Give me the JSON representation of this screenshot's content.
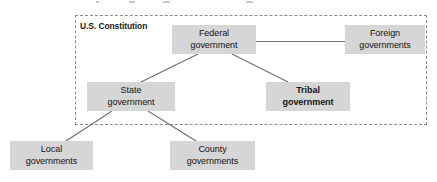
{
  "diagram": {
    "boundary": {
      "label": "U.S. Constitution",
      "border_style": "dashed",
      "border_color": "#8c8c8c"
    },
    "node_fill_color": "#d6d6d6",
    "node_text_color": "#141414",
    "connector_color": "#6e6e6e",
    "nodes": [
      {
        "id": "federal",
        "lines": [
          "Federal",
          "government"
        ],
        "bold": false,
        "inside_boundary": true,
        "x": 172,
        "y": 25,
        "w": 84,
        "h": 29
      },
      {
        "id": "foreign",
        "lines": [
          "Foreign",
          "governments"
        ],
        "bold": false,
        "inside_boundary": false,
        "x": 345,
        "y": 25,
        "w": 80,
        "h": 29
      },
      {
        "id": "state",
        "lines": [
          "State",
          "government"
        ],
        "bold": false,
        "inside_boundary": true,
        "x": 87,
        "y": 82,
        "w": 88,
        "h": 29
      },
      {
        "id": "tribal",
        "lines": [
          "Tribal",
          "government"
        ],
        "bold": true,
        "inside_boundary": true,
        "x": 266,
        "y": 82,
        "w": 84,
        "h": 29
      },
      {
        "id": "local",
        "lines": [
          "Local",
          "governments"
        ],
        "bold": false,
        "inside_boundary": false,
        "x": 10,
        "y": 141,
        "w": 83,
        "h": 29
      },
      {
        "id": "county",
        "lines": [
          "County",
          "governments"
        ],
        "bold": false,
        "inside_boundary": false,
        "x": 170,
        "y": 141,
        "w": 85,
        "h": 29
      }
    ],
    "connections": [
      {
        "from": "federal",
        "to": "foreign"
      },
      {
        "from": "federal",
        "to": "state"
      },
      {
        "from": "federal",
        "to": "tribal"
      },
      {
        "from": "state",
        "to": "local"
      },
      {
        "from": "state",
        "to": "county"
      }
    ]
  }
}
